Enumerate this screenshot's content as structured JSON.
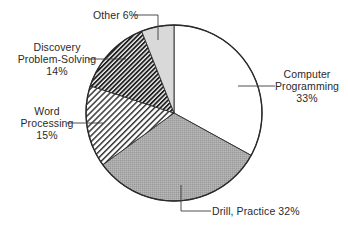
{
  "chart_data": {
    "type": "pie",
    "title": "",
    "start_angle_deg": 0,
    "direction": "clockwise",
    "slices": [
      {
        "label": "Computer Programming",
        "value": 33,
        "display": [
          "Computer",
          "Programming",
          "33%"
        ],
        "fill": "white"
      },
      {
        "label": "Drill, Practice",
        "value": 32,
        "display": [
          "Drill, Practice 32%"
        ],
        "fill": "gray-stipple"
      },
      {
        "label": "Word Processing",
        "value": 15,
        "display": [
          "Word",
          "Processing",
          "15%"
        ],
        "fill": "light-diagonal-hatch"
      },
      {
        "label": "Discovery Problem-Solving",
        "value": 14,
        "display": [
          "Discovery",
          "Problem-Solving",
          "14%"
        ],
        "fill": "dense-diagonal-hatch"
      },
      {
        "label": "Other",
        "value": 6,
        "display": [
          "Other 6%"
        ],
        "fill": "light-gray"
      }
    ],
    "legend": "none (callout labels with leader lines)",
    "colors": {
      "outline": "#2a2a2a",
      "programming": "#ffffff",
      "drill": "#a9a9a9",
      "word_hatch": "#3a3a3a",
      "discovery_hatch": "#1e1e1e",
      "other": "#d9d9d9"
    }
  },
  "labels": {
    "programming": {
      "line1": "Computer",
      "line2": "Programming",
      "line3": "33%"
    },
    "drill": {
      "line1": "Drill, Practice 32%"
    },
    "word": {
      "line1": "Word",
      "line2": "Processing",
      "line3": "15%"
    },
    "discovery": {
      "line1": "Discovery",
      "line2": "Problem-Solving",
      "line3": "14%"
    },
    "other": {
      "line1": "Other 6%"
    }
  }
}
